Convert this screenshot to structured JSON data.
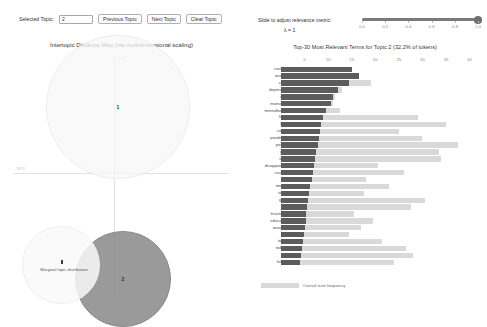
{
  "controls": {
    "selected_topic_label": "Selected Topic:",
    "selected_topic_value": "2",
    "previous_topic_label": "Previous Topic",
    "next_topic_label": "Next Topic",
    "clear_topic_label": "Clear Topic"
  },
  "slider": {
    "label": "Slide to adjust relevance metric:",
    "lambda_label": "λ = 1",
    "value": 1.0,
    "ticks": [
      "0.0",
      "0.2",
      "0.4",
      "0.6",
      "0.8",
      "1.0"
    ]
  },
  "left_chart": {
    "title": "Intertopic Distance Map (via multidimensional scaling)",
    "axis_x_label": "PC1",
    "axis_y_label": "PC2",
    "legend_title": "Marginal topic distribution",
    "topics": [
      {
        "id": "1",
        "x": 47,
        "y": 22,
        "r": 34,
        "selected": false
      },
      {
        "id": "2",
        "x": 56,
        "y": 80,
        "r": 22,
        "selected": true
      }
    ]
  },
  "chart_data": {
    "type": "bar",
    "title": "Top-30 Most Relevant Terms for Topic 2 (32.2% of tokens)",
    "xlabel": "",
    "ylabel": "",
    "xlim": [
      0,
      42
    ],
    "grid": false,
    "legend_position": "bottom",
    "legend": [
      "Overall term frequency",
      "Estimated term frequency within the selected topic"
    ],
    "categories": [
      "covid19",
      "anxieta",
      "covid",
      "depressed",
      "ohio",
      "motivated",
      "mentalhealth",
      "hope",
      "time",
      "stress",
      "pandemic",
      "people",
      "year",
      "work",
      "disappointed",
      "country",
      "girl",
      "mental",
      "tanks",
      "good",
      "life",
      "frustrated",
      "education",
      "anxiexta",
      "due",
      "today",
      "today2",
      "like",
      "health"
    ],
    "series": [
      {
        "name": "Overall term frequency",
        "values": [
          15.0,
          16.5,
          19.0,
          13.0,
          11.5,
          11.0,
          12.5,
          29.0,
          35.0,
          25.0,
          30.0,
          37.5,
          33.5,
          34.0,
          20.5,
          26.0,
          18.0,
          23.0,
          17.5,
          30.5,
          27.5,
          15.5,
          19.5,
          17.0,
          14.5,
          21.5,
          26.5,
          28.0,
          24.0
        ]
      },
      {
        "name": "Estimated term frequency within the selected topic",
        "values": [
          15.0,
          16.5,
          14.5,
          12.0,
          11.0,
          10.5,
          9.5,
          9.0,
          8.5,
          8.2,
          8.0,
          7.8,
          7.5,
          7.2,
          7.0,
          6.8,
          6.5,
          6.2,
          6.0,
          5.8,
          5.6,
          5.4,
          5.2,
          5.0,
          4.8,
          4.6,
          4.4,
          4.2,
          4.0
        ]
      }
    ],
    "xticks": [
      5,
      10,
      15,
      20,
      25,
      30,
      35,
      40
    ]
  }
}
